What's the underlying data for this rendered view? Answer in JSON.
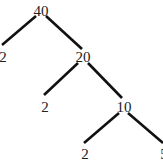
{
  "diagram": {
    "type": "factor-tree",
    "root": "40",
    "nodes": {
      "n40": {
        "label": "40",
        "x": 41,
        "y": 16
      },
      "n2a": {
        "label": "2",
        "x": 3,
        "y": 61
      },
      "n20": {
        "label": "20",
        "x": 83,
        "y": 61
      },
      "n2b": {
        "label": "2",
        "x": 45,
        "y": 111
      },
      "n10": {
        "label": "10",
        "x": 124,
        "y": 111
      },
      "n2c": {
        "label": "2",
        "x": 84,
        "y": 158
      },
      "n5": {
        "label": "5",
        "x": 163,
        "y": 158
      }
    },
    "edges": [
      {
        "from": "40",
        "to": "2"
      },
      {
        "from": "40",
        "to": "20"
      },
      {
        "from": "20",
        "to": "2"
      },
      {
        "from": "20",
        "to": "10"
      },
      {
        "from": "10",
        "to": "2"
      },
      {
        "from": "10",
        "to": "5"
      }
    ],
    "colors": {
      "line": "#111111",
      "text": "#222222",
      "background": "#ffffff"
    }
  }
}
